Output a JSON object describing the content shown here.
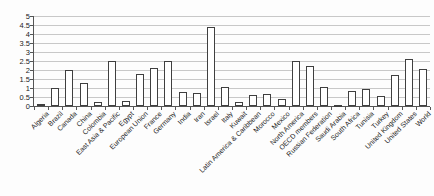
{
  "chart_data": {
    "type": "bar",
    "title": "",
    "xlabel": "",
    "ylabel": "",
    "categories": [
      "Algeria",
      "Brazil",
      "Canada",
      "China",
      "Colombia",
      "East Asia & Pacific",
      "Egypt",
      "European Union",
      "France",
      "Germany",
      "India",
      "Iran",
      "Israel",
      "Italy",
      "Kuwait",
      "Latin America & Caribbean",
      "Morocco",
      "Mexico",
      "North America",
      "OECD members",
      "Russian Federation",
      "Saudi Arabia",
      "South Africa",
      "Tunisia",
      "Turkey",
      "United Kingdom",
      "United States",
      "World"
    ],
    "values": [
      0.1,
      1.0,
      2.0,
      1.3,
      0.2,
      2.5,
      0.3,
      1.8,
      2.1,
      2.5,
      0.75,
      0.7,
      4.4,
      1.05,
      0.2,
      0.6,
      0.65,
      0.4,
      2.5,
      2.2,
      1.05,
      0.05,
      0.85,
      0.95,
      0.55,
      1.7,
      2.6,
      2.05
    ],
    "ylim": [
      0,
      5
    ],
    "ytick_step": 0.5,
    "ytick_labels": [
      "0",
      "0.5",
      "1",
      "1.5",
      "2",
      "2.5",
      "3",
      "3.5",
      "4",
      "4.5",
      "5"
    ],
    "grid": "horizontal",
    "legend": "none",
    "xlabel_rotation_deg": 45,
    "colors": {
      "bar_fill": "#ffffff",
      "bar_border": "#3f3f3f",
      "gridline": "#c8c8c8",
      "axis": "#555555",
      "text": "#1b1b1b",
      "background": "#fdfdfd"
    }
  }
}
